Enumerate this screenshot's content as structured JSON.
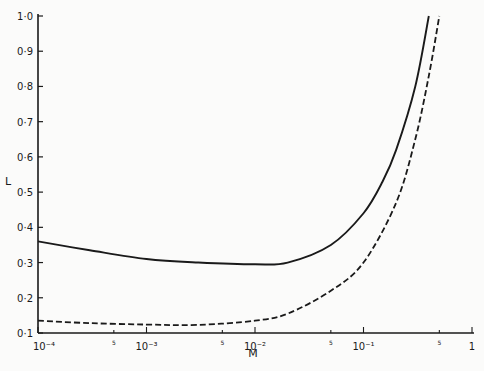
{
  "chart_data": {
    "type": "line",
    "title": "",
    "xlabel": "M",
    "ylabel": "L",
    "xscale": "log",
    "xlim": [
      0.0001,
      1
    ],
    "ylim": [
      0.1,
      1.0
    ],
    "grid": false,
    "legend": null,
    "x_ticks": [
      {
        "value": 0.0001,
        "label": "10⁻⁴"
      },
      {
        "value": 0.0005,
        "label": "5"
      },
      {
        "value": 0.001,
        "label": "10⁻³"
      },
      {
        "value": 0.005,
        "label": "5"
      },
      {
        "value": 0.01,
        "label": "10⁻²"
      },
      {
        "value": 0.05,
        "label": "5"
      },
      {
        "value": 0.1,
        "label": "10⁻¹"
      },
      {
        "value": 0.5,
        "label": "5"
      },
      {
        "value": 1,
        "label": "1"
      }
    ],
    "y_ticks": [
      {
        "value": 0.1,
        "label": "0·1"
      },
      {
        "value": 0.2,
        "label": "0·2"
      },
      {
        "value": 0.3,
        "label": "0·3"
      },
      {
        "value": 0.4,
        "label": "0·4"
      },
      {
        "value": 0.5,
        "label": "0·5"
      },
      {
        "value": 0.6,
        "label": "0·6"
      },
      {
        "value": 0.7,
        "label": "0·7"
      },
      {
        "value": 0.8,
        "label": "0·8"
      },
      {
        "value": 0.9,
        "label": "0·9"
      },
      {
        "value": 1.0,
        "label": "1·0"
      }
    ],
    "series": [
      {
        "name": "solid",
        "style": "solid",
        "x": [
          0.0001,
          0.0003,
          0.001,
          0.003,
          0.01,
          0.02,
          0.05,
          0.1,
          0.15,
          0.2,
          0.3,
          0.4
        ],
        "values": [
          0.36,
          0.335,
          0.31,
          0.3,
          0.295,
          0.3,
          0.35,
          0.44,
          0.53,
          0.62,
          0.8,
          1.0
        ]
      },
      {
        "name": "dashed",
        "style": "dashed",
        "x": [
          0.0001,
          0.0003,
          0.001,
          0.003,
          0.01,
          0.02,
          0.05,
          0.1,
          0.2,
          0.3,
          0.4,
          0.5
        ],
        "values": [
          0.135,
          0.128,
          0.124,
          0.123,
          0.135,
          0.155,
          0.22,
          0.3,
          0.47,
          0.65,
          0.83,
          1.0
        ]
      }
    ]
  },
  "axes": {
    "x_label": "M",
    "y_label": "L"
  }
}
